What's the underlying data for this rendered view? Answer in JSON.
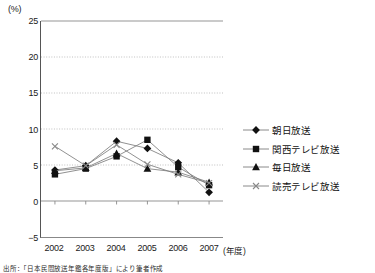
{
  "axis": {
    "y_unit_label": "(%)",
    "y_ticks": [
      "25",
      "20",
      "15",
      "10",
      "5",
      "0",
      "-5"
    ],
    "x_unit_label": "(年度)"
  },
  "source_note": "出所：「日本民間放送年鑑各年度版」により筆者作成",
  "legend": {
    "items": [
      {
        "label": "朝日放送",
        "marker": "diamond",
        "color": "#111111"
      },
      {
        "label": "関西テレビ放送",
        "marker": "square",
        "color": "#111111"
      },
      {
        "label": "毎日放送",
        "marker": "triangle",
        "color": "#111111"
      },
      {
        "label": "読売テレビ放送",
        "marker": "cross",
        "color": "#888888"
      }
    ]
  },
  "chart_data": {
    "type": "line",
    "title": "",
    "xlabel": "(年度)",
    "ylabel": "(%)",
    "categories": [
      "2002",
      "2003",
      "2004",
      "2005",
      "2006",
      "2007"
    ],
    "x": [
      2002,
      2003,
      2004,
      2005,
      2006,
      2007
    ],
    "ylim": [
      -5,
      25
    ],
    "ytick_step": 5,
    "grid": "horizontal-dotted",
    "legend_position": "right",
    "series": [
      {
        "name": "朝日放送",
        "marker": "diamond",
        "color": "#111111",
        "values": [
          4.3,
          4.9,
          8.3,
          7.3,
          5.3,
          1.2
        ]
      },
      {
        "name": "関西テレビ放送",
        "marker": "square",
        "color": "#111111",
        "values": [
          3.7,
          4.5,
          6.2,
          8.5,
          4.7,
          2.2
        ]
      },
      {
        "name": "毎日放送",
        "marker": "triangle",
        "color": "#111111",
        "values": [
          4.2,
          4.6,
          6.6,
          4.5,
          4.0,
          2.6
        ]
      },
      {
        "name": "読売テレビ放送",
        "marker": "cross",
        "color": "#888888",
        "values": [
          7.6,
          4.9,
          7.8,
          5.1,
          3.7,
          2.5
        ]
      }
    ]
  }
}
